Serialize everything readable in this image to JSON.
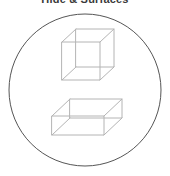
{
  "page": {
    "title": "Hide & Surfaces",
    "background_color": "#ffffff",
    "width": 170,
    "height": 176
  },
  "figure": {
    "name": "two-wireframe-boxes-in-circle",
    "frame": {
      "shape": "circle",
      "center_x": 85,
      "center_y": 90,
      "radius": 76,
      "stroke_color": "#555555",
      "stroke_width": 1,
      "fill": "none"
    },
    "shapes": [
      {
        "name": "wireframe-cube",
        "label": "cube",
        "stroke_color": "#b4b4b4",
        "stroke_width": 1,
        "front_face": {
          "x": 62,
          "y": 42,
          "width": 38,
          "height": 38
        },
        "depth_offset_x": 14,
        "depth_offset_y": -13
      },
      {
        "name": "wireframe-cuboid",
        "label": "flat box",
        "stroke_color": "#b4b4b4",
        "stroke_width": 1,
        "front_face": {
          "x": 52,
          "y": 116,
          "width": 52,
          "height": 19
        },
        "depth_offset_x": 18,
        "depth_offset_y": -17
      }
    ]
  }
}
